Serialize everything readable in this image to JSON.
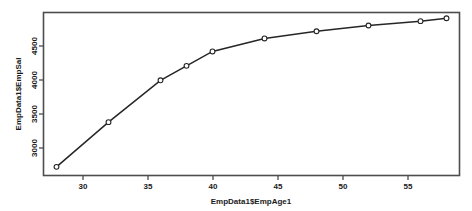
{
  "figure": {
    "background_color": "#ffffff",
    "frame_color": "#4d4d4d",
    "series_color": "#262626",
    "point_fill": "#ffffff"
  },
  "chart_data": {
    "type": "line",
    "title": "",
    "subtitle": "",
    "xlabel": "EmpData1$EmpAge1",
    "ylabel": "EmpData1$EmpSal",
    "x": [
      28,
      32,
      36,
      38,
      40,
      44,
      48,
      52,
      56,
      58
    ],
    "values": [
      2800,
      3420,
      4000,
      4200,
      4400,
      4580,
      4680,
      4760,
      4820,
      4860
    ],
    "series": [
      {
        "name": "EmpData1$EmpSal",
        "values": [
          2800,
          3420,
          4000,
          4200,
          4400,
          4580,
          4680,
          4760,
          4820,
          4860
        ]
      }
    ],
    "xlim": [
      27,
      59
    ],
    "ylim": [
      2680,
      4940
    ],
    "xticks": [
      30,
      35,
      40,
      45,
      50,
      55
    ],
    "xtick_labels": [
      "30",
      "35",
      "40",
      "45",
      "50",
      "55"
    ],
    "yticks": [
      3000,
      3500,
      4000,
      4500
    ],
    "ytick_labels": [
      "3000",
      "3500",
      "4000",
      "4500"
    ],
    "grid": false,
    "legend": false,
    "legend_position": "none",
    "marker": "open-circle",
    "line_style": "solid"
  }
}
